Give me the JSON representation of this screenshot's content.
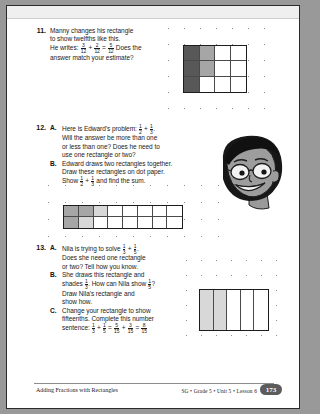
{
  "page": {
    "footer": {
      "title": "Adding Fractions with Rectangles",
      "meta": "SG • Grade 5 • Unit 5 • Lesson 6",
      "page_number": "173"
    }
  },
  "problems": [
    {
      "number": "11.",
      "lines": [
        "Manny changes his rectangle",
        "to show twelfths like this.",
        "He writes: ",
        "answer match your estimate?"
      ],
      "inline_expression": {
        "a_num": "3",
        "a_den": "12",
        "b_num": "2",
        "b_den": "12",
        "c_num": "5",
        "c_den": "12",
        "tail": " Does the"
      },
      "grid": {
        "cols": 4,
        "rows": 3,
        "shading": [
          [
            "dark",
            "mid",
            "none",
            "none"
          ],
          [
            "dark",
            "mid",
            "none",
            "none"
          ],
          [
            "dark",
            "none",
            "none",
            "none"
          ]
        ]
      }
    },
    {
      "number": "12.",
      "parts": [
        {
          "letter": "A.",
          "lines": [
            "Here is Edward's problem: ",
            "Will the answer be more than one",
            "or less than one? Does he need to",
            "use one rectangle or two?"
          ],
          "expression": {
            "a_num": "1",
            "a_den": "2",
            "b_num": "1",
            "b_den": "3"
          }
        },
        {
          "letter": "B.",
          "lines": [
            "Edward draws two rectangles together.",
            "Draw these rectangles on dot paper.",
            "Show "
          ],
          "expression": {
            "a_num": "1",
            "a_den": "2",
            "b_num": "1",
            "b_den": "3"
          },
          "tail": " and find the sum."
        }
      ],
      "grid": {
        "cols": 8,
        "rows": 2,
        "shading": [
          [
            "mid",
            "mid",
            "lite",
            "none",
            "none",
            "none",
            "none",
            "none"
          ],
          [
            "mid",
            "lite",
            "none",
            "none",
            "none",
            "none",
            "none",
            "none"
          ]
        ]
      }
    },
    {
      "number": "13.",
      "parts": [
        {
          "letter": "A.",
          "lines": [
            "Nila is trying to solve ",
            "Does she need one rectangle",
            "or two? Tell how you know."
          ],
          "expression": {
            "a_num": "1",
            "a_den": "3",
            "b_num": "1",
            "b_den": "5"
          }
        },
        {
          "letter": "B.",
          "lines": [
            "She draws this rectangle and",
            "shades ",
            "Draw Nila's rectangle and",
            "show how."
          ],
          "shade_frac": {
            "num": "1",
            "den": "3"
          },
          "mid_text": " How can Nila show ",
          "ask_frac": {
            "num": "1",
            "den": "5"
          },
          "question": "?"
        },
        {
          "letter": "C.",
          "lines": [
            "Change your rectangle to show",
            "fifteenths. Complete this number",
            "sentence: "
          ],
          "sentence": {
            "a_num": "1",
            "a_den": "3",
            "b_num": "1",
            "b_den": "5",
            "c_num": "5",
            "c_den": "15",
            "d_num": "3",
            "d_den": "15",
            "e_num": "8",
            "e_den": "15"
          }
        }
      ],
      "grid": {
        "cols": 5,
        "rows": 1,
        "shading": [
          [
            "lite",
            "lite",
            "none",
            "none",
            "none"
          ]
        ]
      }
    }
  ],
  "illustration": {
    "name": "boy-with-glasses-cartoon"
  }
}
